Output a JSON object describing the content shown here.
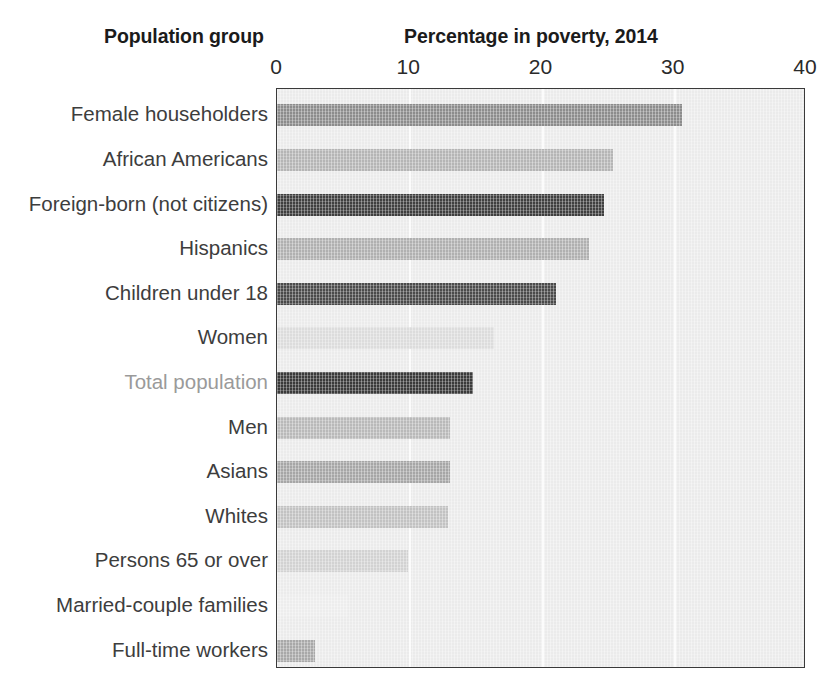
{
  "headers": {
    "group_header": "Population group",
    "axis_header": "Percentage in poverty, 2014"
  },
  "axis": {
    "ticks": [
      {
        "label": "0",
        "value": 0
      },
      {
        "label": "10",
        "value": 10
      },
      {
        "label": "20",
        "value": 20
      },
      {
        "label": "30",
        "value": 30
      },
      {
        "label": "40",
        "value": 40
      }
    ]
  },
  "chart_data": {
    "type": "bar",
    "orientation": "horizontal",
    "title": "Percentage in poverty, 2014",
    "xlabel": "Percentage in poverty, 2014",
    "ylabel": "Population group",
    "xlim": [
      0,
      40
    ],
    "grid": true,
    "legend": "none",
    "plot_background": "#ebebeb",
    "categories": [
      "Female householders",
      "African Americans",
      "Foreign-born (not citizens)",
      "Hispanics",
      "Children under 18",
      "Women",
      "Total population",
      "Men",
      "Asians",
      "Whites",
      "Persons 65 or over",
      "Married-couple families",
      "Full-time workers"
    ],
    "values": [
      30.6,
      25.4,
      24.7,
      23.6,
      21.1,
      16.4,
      14.8,
      13.1,
      13.1,
      12.9,
      9.9,
      5.4,
      2.9
    ],
    "bar_colors": [
      "#8c8c8c",
      "#b5b5b5",
      "#3f3f3f",
      "#b0b0b0",
      "#4a4a4a",
      "#dcdcdc",
      "#3a3a3a",
      "#b9b9b9",
      "#a6a6a6",
      "#c2c2c2",
      "#d2d2d2",
      "#ededed",
      "#a8a8a8"
    ],
    "label_colors": [
      "#3d3d3d",
      "#3d3d3d",
      "#3d3d3d",
      "#3d3d3d",
      "#3d3d3d",
      "#3d3d3d",
      "#9a9a9a",
      "#3d3d3d",
      "#3d3d3d",
      "#3d3d3d",
      "#3d3d3d",
      "#3d3d3d",
      "#3d3d3d"
    ]
  }
}
